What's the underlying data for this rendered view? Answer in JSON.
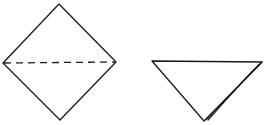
{
  "diagram": {
    "type": "origami-fold-steps",
    "stroke_color": "#1a1a1a",
    "background": "#ffffff",
    "steps": [
      {
        "name": "square-diamond",
        "shape": "diamond",
        "points": [
          [
            59,
            4
          ],
          [
            116,
            62
          ],
          [
            60,
            120
          ],
          [
            3,
            63
          ]
        ],
        "fold_line": {
          "style": "dashed",
          "from": [
            3,
            63
          ],
          "to": [
            116,
            62
          ],
          "meaning": "valley-fold"
        }
      },
      {
        "name": "folded-triangle",
        "shape": "triangle",
        "points": [
          [
            152,
            61
          ],
          [
            262,
            62
          ],
          [
            204,
            121
          ]
        ],
        "layer_edge": {
          "from": [
            262,
            62
          ],
          "to": [
            208,
            121
          ]
        }
      }
    ]
  }
}
